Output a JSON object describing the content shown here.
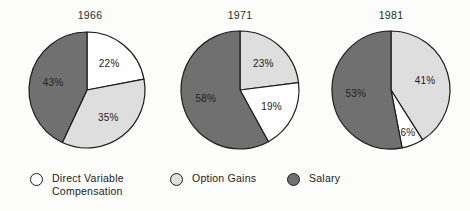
{
  "figure": {
    "background_color": "#fcfcfa",
    "width": 470,
    "height": 211
  },
  "chart_data": {
    "type": "pie",
    "title": "",
    "subtitle": "",
    "xlabel": "",
    "ylabel": "",
    "grid": false,
    "legend_position": "bottom",
    "value_unit": "%",
    "start_angle_clock": "12 o'clock",
    "direction": "clockwise",
    "categories": [
      "Direct Variable Compensation",
      "Option Gains",
      "Salary"
    ],
    "category_colors": [
      "#ffffff",
      "#dedede",
      "#707070"
    ],
    "panels": [
      {
        "title": "1966",
        "slices": [
          {
            "label": "22%",
            "value": 22,
            "category": "Direct Variable Compensation",
            "color": "#ffffff"
          },
          {
            "label": "35%",
            "value": 35,
            "category": "Option Gains",
            "color": "#dedede"
          },
          {
            "label": "43%",
            "value": 43,
            "category": "Salary",
            "color": "#707070"
          }
        ]
      },
      {
        "title": "1971",
        "slices": [
          {
            "label": "23%",
            "value": 23,
            "category": "Option Gains",
            "color": "#dedede"
          },
          {
            "label": "19%",
            "value": 19,
            "category": "Direct Variable Compensation",
            "color": "#ffffff"
          },
          {
            "label": "58%",
            "value": 58,
            "category": "Salary",
            "color": "#707070"
          }
        ]
      },
      {
        "title": "1981",
        "slices": [
          {
            "label": "41%",
            "value": 41,
            "category": "Option Gains",
            "color": "#dedede"
          },
          {
            "label": "6%",
            "value": 6,
            "category": "Direct Variable Compensation",
            "color": "#ffffff"
          },
          {
            "label": "53%",
            "value": 53,
            "category": "Salary",
            "color": "#707070"
          }
        ]
      }
    ],
    "legend": [
      {
        "label": "Direct Variable\nCompensation",
        "color": "#ffffff",
        "swatch": "circle-outline-icon"
      },
      {
        "label": "Option Gains",
        "color": "#dedede",
        "swatch": "circle-light-icon"
      },
      {
        "label": "Salary",
        "color": "#707070",
        "swatch": "circle-dark-icon"
      }
    ]
  },
  "layout": {
    "pies": [
      {
        "cx": 87,
        "cy": 90,
        "r": 58
      },
      {
        "cx": 240,
        "cy": 90,
        "r": 59
      },
      {
        "cx": 391,
        "cy": 90,
        "r": 59
      }
    ],
    "titles": [
      {
        "x": 90,
        "y": 9
      },
      {
        "x": 240,
        "y": 9
      },
      {
        "x": 391,
        "y": 9
      }
    ],
    "legend_items": [
      {
        "x": 30,
        "y": 6
      },
      {
        "x": 170,
        "y": 6
      },
      {
        "x": 287,
        "y": 6
      }
    ],
    "label_radius_factor": 0.6,
    "stroke": "#1c1c1c",
    "stroke_width": 1.2
  }
}
